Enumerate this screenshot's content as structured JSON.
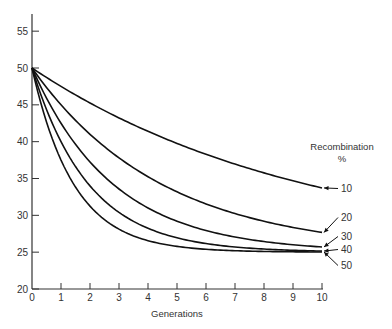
{
  "chart_data": {
    "type": "line",
    "title": "",
    "xlabel": "Generations",
    "ylabel": "",
    "xlim": [
      0,
      10
    ],
    "ylim": [
      20,
      57
    ],
    "x_ticks": [
      0,
      1,
      2,
      3,
      4,
      5,
      6,
      7,
      8,
      9,
      10
    ],
    "y_ticks": [
      20,
      25,
      30,
      35,
      40,
      45,
      50,
      55
    ],
    "grid": false,
    "legend": {
      "title": "Recombination",
      "subtitle": "%",
      "position": "right, arrows pointing to curve ends"
    },
    "x": [
      0,
      1,
      2,
      3,
      4,
      5,
      6,
      7,
      8,
      9,
      10
    ],
    "series": [
      {
        "name": "10",
        "values": [
          50,
          47.5,
          45.25,
          43.23,
          41.4,
          39.76,
          38.29,
          36.96,
          35.76,
          34.69,
          33.72
        ]
      },
      {
        "name": "20",
        "values": [
          50,
          45.0,
          41.0,
          37.8,
          35.24,
          33.19,
          31.55,
          30.24,
          29.19,
          28.36,
          27.68
        ]
      },
      {
        "name": "30",
        "values": [
          50,
          42.5,
          37.25,
          33.58,
          31.0,
          29.2,
          27.94,
          27.06,
          26.44,
          26.01,
          25.71
        ]
      },
      {
        "name": "40",
        "values": [
          50,
          40.0,
          34.0,
          30.4,
          28.24,
          26.94,
          26.17,
          25.7,
          25.42,
          25.25,
          25.15
        ]
      },
      {
        "name": "50",
        "values": [
          50,
          37.5,
          31.25,
          28.13,
          26.56,
          25.78,
          25.39,
          25.2,
          25.1,
          25.05,
          25.02
        ]
      }
    ],
    "annotations": [
      "Recombination %",
      "10",
      "20",
      "30",
      "40",
      "50"
    ]
  },
  "axis": {
    "x_label": "Generations",
    "x_tick_labels": [
      "0",
      "1",
      "2",
      "3",
      "4",
      "5",
      "6",
      "7",
      "8",
      "9",
      "10"
    ],
    "y_tick_labels": [
      "20",
      "25",
      "30",
      "35",
      "40",
      "45",
      "50",
      "55"
    ]
  },
  "legend": {
    "title": "Recombination",
    "unit": "%",
    "labels": [
      "10",
      "20",
      "30",
      "40",
      "50"
    ]
  },
  "colors": {
    "line": "#111111",
    "axis": "#333333",
    "text": "#333333"
  }
}
